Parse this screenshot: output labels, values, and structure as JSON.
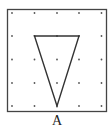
{
  "figure": {
    "label": "A",
    "grid": {
      "rows": 5,
      "cols": 5
    },
    "triangle_vertices_grid": [
      [
        1,
        1
      ],
      [
        3,
        1
      ],
      [
        2,
        4
      ]
    ],
    "colors": {
      "border": "#444444",
      "dot": "#555555",
      "line": "#333333"
    }
  }
}
